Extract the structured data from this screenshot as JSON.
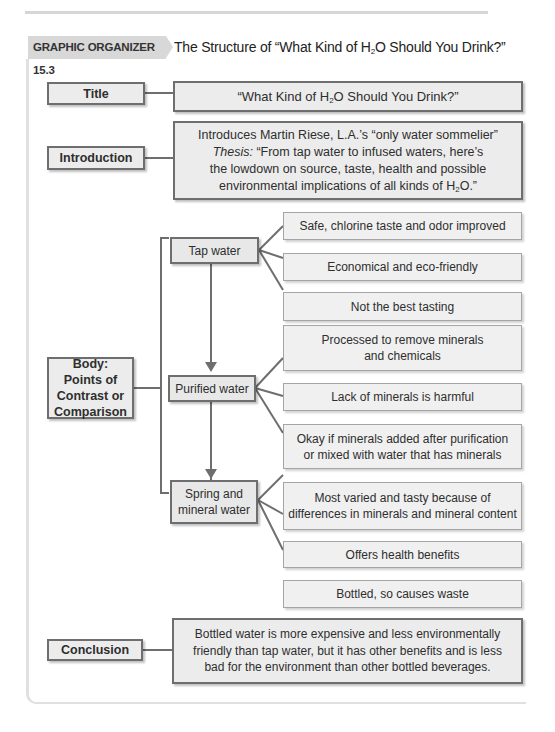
{
  "header": {
    "badge": "GRAPHIC ORGANIZER 15.3",
    "title_prefix": "The Structure of “What Kind of H",
    "title_sub": "2",
    "title_suffix": "O Should You Drink?”"
  },
  "sections": {
    "title": {
      "label": "Title",
      "content_prefix": "“What Kind of H",
      "content_sub": "2",
      "content_suffix": "O Should You Drink?”"
    },
    "introduction": {
      "label": "Introduction",
      "line1": "Introduces Martin Riese, L.A.’s “only water sommelier”",
      "thesis_label": "Thesis:",
      "thesis_text_a": " “From tap water to infused waters, here’s",
      "thesis_text_b": "the lowdown on source, taste, health and possible",
      "thesis_text_c": "environmental implications of all kinds of H",
      "thesis_sub": "2",
      "thesis_text_d": "O.”"
    },
    "body": {
      "label": "Body: Points of Contrast or Comparison",
      "categories": [
        {
          "name": "Tap water",
          "points": [
            "Safe, chlorine taste and odor improved",
            "Economical and eco-friendly",
            "Not the best tasting"
          ]
        },
        {
          "name": "Purified water",
          "points": [
            "Processed to remove minerals and chemicals",
            "Lack of minerals is harmful",
            "Okay if minerals added after purification or mixed with water that has minerals"
          ]
        },
        {
          "name": "Spring and mineral water",
          "points": [
            "Most varied and tasty because of differences in minerals and mineral content",
            "Offers health benefits",
            "Bottled, so causes waste"
          ]
        }
      ]
    },
    "conclusion": {
      "label": "Conclusion",
      "content": "Bottled water is more expensive and less environmentally friendly than tap water, but it has other benefits and is less bad for the environment than other bottled beverages."
    }
  },
  "colors": {
    "box_fill": "#ececec",
    "box_border": "#6e6e6e",
    "badge_fill": "#d8d8d8",
    "connector": "#6e6e6e"
  }
}
